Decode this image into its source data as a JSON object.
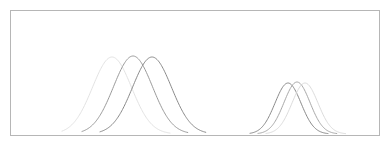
{
  "figure": {
    "background_color": "#ffffff",
    "frame": {
      "x": 10,
      "y": 10,
      "width": 369,
      "height": 125,
      "stroke_color": "#b6b6b6",
      "stroke_width": 1,
      "fill": "none"
    }
  },
  "chart_data": {
    "type": "line",
    "title": "",
    "subtitle": "",
    "xlabel": "",
    "ylabel": "",
    "xlim": [
      0,
      388
    ],
    "ylim": [
      0,
      145
    ],
    "grid": false,
    "legend": "none",
    "tick_labels_x": [],
    "tick_labels_y": [],
    "annotations": [],
    "baseline_y": 134,
    "series": [
      {
        "name": "left-curve-1",
        "cluster": "left",
        "peak_x": 112,
        "peak_y": 57,
        "amplitude": 77,
        "sigma": 19.5,
        "x_start": 62,
        "x_end": 170,
        "color": "#e3e3e3",
        "stroke_width": 1
      },
      {
        "name": "left-curve-2",
        "cluster": "left",
        "peak_x": 133,
        "peak_y": 56,
        "amplitude": 78,
        "sigma": 19.5,
        "x_start": 82,
        "x_end": 188,
        "color": "#9a9a9a",
        "stroke_width": 1
      },
      {
        "name": "left-curve-3",
        "cluster": "left",
        "peak_x": 152,
        "peak_y": 57,
        "amplitude": 77,
        "sigma": 19.5,
        "x_start": 100,
        "x_end": 206,
        "color": "#8a8a8a",
        "stroke_width": 1
      },
      {
        "name": "right-curve-1",
        "cluster": "right",
        "peak_x": 288,
        "peak_y": 83,
        "amplitude": 51,
        "sigma": 13.0,
        "x_start": 250,
        "x_end": 328,
        "color": "#8a8a8a",
        "stroke_width": 1
      },
      {
        "name": "right-curve-2",
        "cluster": "right",
        "peak_x": 297,
        "peak_y": 82,
        "amplitude": 52,
        "sigma": 13.0,
        "x_start": 258,
        "x_end": 337,
        "color": "#a8a8a8",
        "stroke_width": 1
      },
      {
        "name": "right-curve-3",
        "cluster": "right",
        "peak_x": 305,
        "peak_y": 83,
        "amplitude": 51,
        "sigma": 13.0,
        "x_start": 266,
        "x_end": 346,
        "color": "#dcdcdc",
        "stroke_width": 1
      }
    ]
  }
}
